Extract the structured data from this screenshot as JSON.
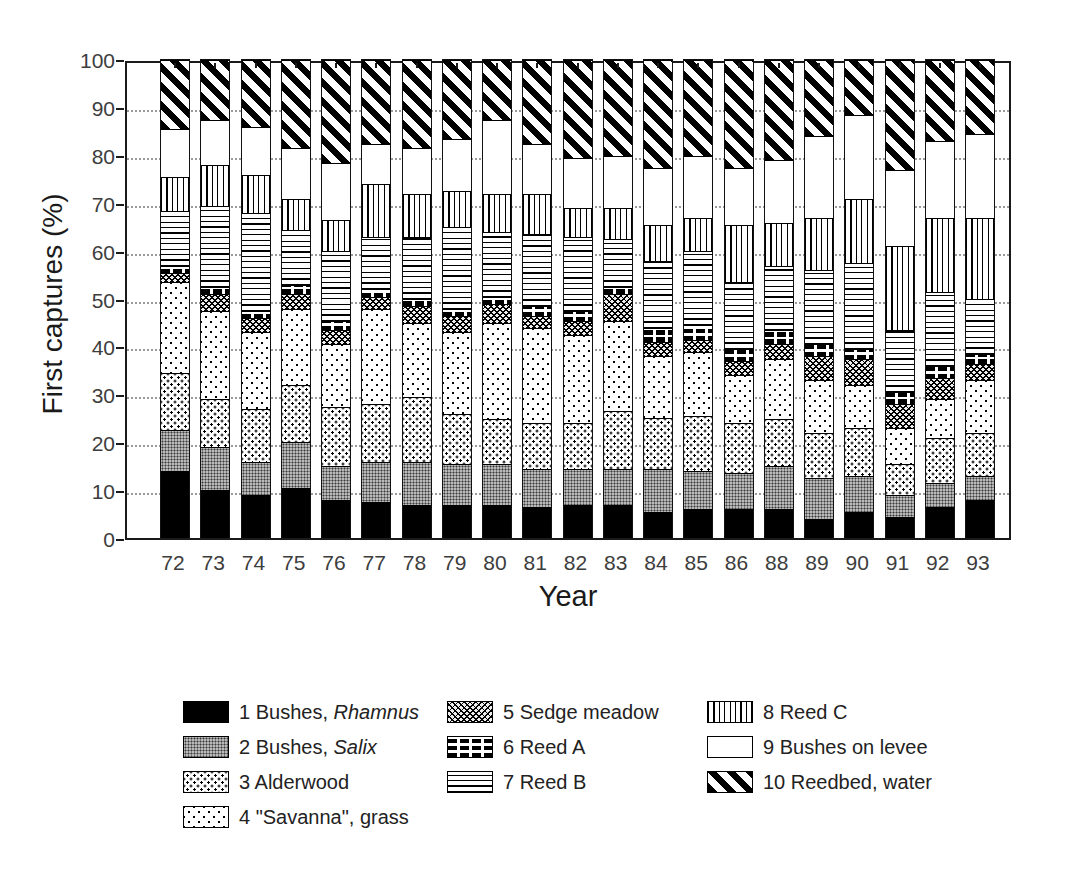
{
  "figure": {
    "ylabel": "First captures (%)",
    "xlabel": "Year"
  },
  "axis": {
    "yticks": [
      0,
      10,
      20,
      30,
      40,
      50,
      60,
      70,
      80,
      90,
      100
    ]
  },
  "chart_data": {
    "type": "bar",
    "stacked": true,
    "stack_total": 100,
    "title": "",
    "xlabel": "Year",
    "ylabel": "First captures (%)",
    "ylim": [
      0,
      100
    ],
    "grid": "dotted-horizontal",
    "legend_position": "bottom",
    "note_years_skipped": "87",
    "categories": [
      "72",
      "73",
      "74",
      "75",
      "76",
      "77",
      "78",
      "79",
      "80",
      "81",
      "82",
      "83",
      "84",
      "85",
      "86",
      "88",
      "89",
      "90",
      "91",
      "92",
      "93"
    ],
    "series": [
      {
        "name": "1 Bushes, Rhamnus",
        "pattern": "solid-black",
        "values": [
          14,
          10,
          9,
          10.5,
          8,
          7.5,
          7,
          7,
          7,
          6.5,
          7,
          7,
          5.5,
          6,
          6,
          6,
          4,
          5.5,
          4.5,
          6.5,
          8
        ]
      },
      {
        "name": "2 Bushes, Salix",
        "pattern": "gray-stipple",
        "values": [
          8.5,
          9,
          7,
          9.5,
          7,
          8.5,
          9,
          8.5,
          8.5,
          8,
          7.5,
          7.5,
          9,
          8,
          7.5,
          9,
          8.5,
          7.5,
          4.5,
          5,
          5
        ]
      },
      {
        "name": "3 Alderwood",
        "pattern": "dots-dense",
        "values": [
          12,
          10,
          11,
          12,
          12.5,
          12,
          13.5,
          10.5,
          9.5,
          9.5,
          9.5,
          12,
          10.5,
          11.5,
          10.5,
          10,
          9.5,
          10,
          6.5,
          9.5,
          9
        ]
      },
      {
        "name": "4 \"Savanna\", grass",
        "pattern": "dots-sparse",
        "values": [
          19,
          18.5,
          16,
          16,
          13,
          20,
          15.5,
          17,
          20,
          20,
          18.5,
          19,
          13,
          13.5,
          10,
          12.5,
          11,
          9,
          7.5,
          8,
          11
        ]
      },
      {
        "name": "5 Sedge meadow",
        "pattern": "crosshatch",
        "values": [
          2,
          3.5,
          3,
          3,
          3,
          2.5,
          3.5,
          3.5,
          4,
          2.5,
          3,
          5.5,
          3,
          2.5,
          3,
          3,
          5,
          5.5,
          5,
          4.5,
          3.5
        ]
      },
      {
        "name": "6 Reed A",
        "pattern": "black-bricks",
        "values": [
          1.5,
          1.5,
          1.5,
          2,
          2,
          1.5,
          1.5,
          1.5,
          1.5,
          2,
          2,
          1.5,
          3,
          3,
          2.5,
          3,
          2.5,
          2,
          2.5,
          2.5,
          2
        ]
      },
      {
        "name": "7 Reed B",
        "pattern": "hlines",
        "values": [
          11.5,
          17,
          20.5,
          11.5,
          14.5,
          11,
          13,
          17,
          13.5,
          15,
          15.5,
          10,
          14,
          15.5,
          14,
          13.5,
          15.5,
          18,
          13,
          15.5,
          11.5
        ]
      },
      {
        "name": "8 Reed C",
        "pattern": "vlines",
        "values": [
          7,
          8.5,
          8,
          6.5,
          6.5,
          11,
          9,
          7.5,
          8,
          8.5,
          6,
          6.5,
          7.5,
          7,
          12,
          9,
          11,
          13.5,
          17.5,
          15.5,
          17
        ]
      },
      {
        "name": "9 Bushes on levee",
        "pattern": "white",
        "values": [
          10,
          9.5,
          10,
          10.5,
          12,
          8.5,
          9.5,
          11,
          15.5,
          10.5,
          10.5,
          11,
          12,
          13,
          12,
          13,
          17,
          17.5,
          16,
          16,
          17.5
        ]
      },
      {
        "name": "10 Reedbed, water",
        "pattern": "diagonal-stripes",
        "values": [
          14.5,
          12.5,
          14,
          18.5,
          21.5,
          17.5,
          18.5,
          16.5,
          12.5,
          17.5,
          20.5,
          20,
          22.5,
          20,
          22.5,
          21,
          16,
          11.5,
          23,
          17,
          15.5
        ]
      }
    ]
  },
  "legend": {
    "items": [
      {
        "prefix": "1 Bushes, ",
        "italic": "Rhamnus",
        "pattern": "solid-black",
        "col": 0,
        "row": 0
      },
      {
        "prefix": "2 Bushes, ",
        "italic": "Salix",
        "pattern": "gray-stipple",
        "col": 0,
        "row": 1
      },
      {
        "prefix": "3 Alderwood",
        "italic": "",
        "pattern": "dots-dense",
        "col": 0,
        "row": 2
      },
      {
        "prefix": "4 \"Savanna\", grass",
        "italic": "",
        "pattern": "dots-sparse",
        "col": 0,
        "row": 3
      },
      {
        "prefix": "5 Sedge meadow",
        "italic": "",
        "pattern": "crosshatch",
        "col": 1,
        "row": 0
      },
      {
        "prefix": "6 Reed A",
        "italic": "",
        "pattern": "black-bricks",
        "col": 1,
        "row": 1
      },
      {
        "prefix": "7 Reed B",
        "italic": "",
        "pattern": "hlines",
        "col": 1,
        "row": 2
      },
      {
        "prefix": "8 Reed C",
        "italic": "",
        "pattern": "vlines",
        "col": 2,
        "row": 0
      },
      {
        "prefix": "9 Bushes on levee",
        "italic": "",
        "pattern": "white",
        "col": 2,
        "row": 1
      },
      {
        "prefix": "10 Reedbed, water",
        "italic": "",
        "pattern": "diagonal-stripes",
        "col": 2,
        "row": 2
      }
    ]
  }
}
